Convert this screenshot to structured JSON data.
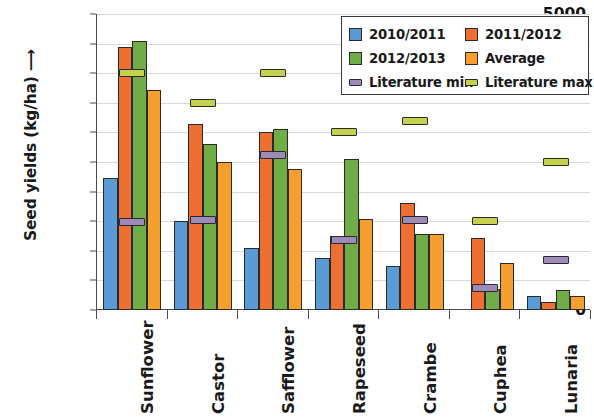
{
  "chart_data": {
    "type": "bar",
    "title": "",
    "xlabel": "",
    "ylabel": "Seed yields (kg/ha) ⟶",
    "ylim": [
      0,
      5000
    ],
    "ytick_values": [
      0,
      500,
      1000,
      1500,
      2000,
      2500,
      3000,
      3500,
      4000,
      4500,
      5000
    ],
    "ytick_labels": [
      "0",
      "500",
      "1000",
      "1500",
      "2000",
      "2500",
      "3000",
      "3500",
      "4000",
      "4500",
      "5000"
    ],
    "grid": true,
    "legend_position": "top-right",
    "categories": [
      "Sunflower",
      "Castor",
      "Safflower",
      "Rapeseed",
      "Crambe",
      "Cuphea",
      "Lunaria"
    ],
    "series": [
      {
        "name": "2010/2011",
        "type": "bar",
        "color": "#5B9BD5",
        "values": [
          2230,
          1510,
          1050,
          880,
          750,
          0,
          230
        ]
      },
      {
        "name": "2011/2012",
        "type": "bar",
        "color": "#ED6F32",
        "values": [
          4450,
          3150,
          3000,
          1250,
          1800,
          1220,
          130
        ]
      },
      {
        "name": "2012/2013",
        "type": "bar",
        "color": "#70AD47",
        "values": [
          4550,
          2800,
          3050,
          2550,
          1280,
          350,
          330
        ]
      },
      {
        "name": "Average",
        "type": "bar",
        "color": "#F5A02E",
        "values": [
          3720,
          2500,
          2390,
          1530,
          1280,
          790,
          230
        ]
      },
      {
        "name": "Literature min",
        "type": "marker",
        "color": "#9E8AB8",
        "values": [
          1480,
          1520,
          2610,
          1180,
          1520,
          370,
          850
        ]
      },
      {
        "name": "Literature max",
        "type": "marker",
        "color": "#C3D24A",
        "values": [
          4000,
          3500,
          4000,
          3000,
          3200,
          1500,
          2500
        ]
      }
    ]
  },
  "legend": {
    "items": [
      {
        "label": "2010/2011",
        "color": "#5B9BD5",
        "shape": "square"
      },
      {
        "label": "2011/2012",
        "color": "#ED6F32",
        "shape": "square"
      },
      {
        "label": "2012/2013",
        "color": "#70AD47",
        "shape": "square"
      },
      {
        "label": "Average",
        "color": "#F5A02E",
        "shape": "square"
      },
      {
        "label": "Literature min",
        "color": "#9E8AB8",
        "shape": "dash"
      },
      {
        "label": "Literature max",
        "color": "#C3D24A",
        "shape": "dash"
      }
    ]
  }
}
